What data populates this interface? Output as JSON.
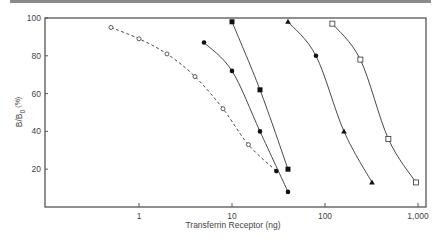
{
  "chart_data": {
    "type": "line",
    "title": "",
    "xlabel": "Transferrin Receptor  (ng)",
    "ylabel": "B/B0 (%)",
    "ylabel_main": "B/B",
    "ylabel_sub": "0",
    "ylabel_unit": " (%)",
    "x_scale": "log",
    "xlim": [
      0.3,
      1100
    ],
    "ylim": [
      0,
      100
    ],
    "x_ticks": [
      1,
      10,
      100,
      1000
    ],
    "x_tick_labels": [
      "1",
      "10",
      "100",
      "1,000"
    ],
    "y_ticks": [
      20,
      40,
      60,
      80,
      100
    ],
    "y_tick_labels": [
      "20",
      "40",
      "60",
      "80",
      "100"
    ],
    "grid": false,
    "legend": null,
    "series": [
      {
        "name": "open-circle-dashed",
        "marker": "open-circle",
        "line": "dashed",
        "x": [
          0.5,
          1,
          2,
          4,
          8,
          15,
          30
        ],
        "y": [
          95,
          89,
          81,
          69,
          52,
          33,
          19
        ]
      },
      {
        "name": "filled-circle",
        "marker": "filled-circle",
        "line": "solid",
        "x": [
          5,
          10,
          20,
          40
        ],
        "y": [
          87,
          72,
          40,
          8
        ]
      },
      {
        "name": "filled-square",
        "marker": "filled-square",
        "line": "solid",
        "x": [
          10,
          20,
          40
        ],
        "y": [
          98,
          62,
          20
        ]
      },
      {
        "name": "filled-triangle",
        "marker": "filled-triangle",
        "line": "solid",
        "x": [
          40,
          80,
          160,
          320
        ],
        "y": [
          98,
          80,
          40,
          13
        ]
      },
      {
        "name": "open-square",
        "marker": "open-square",
        "line": "solid",
        "x": [
          120,
          240,
          480,
          950
        ],
        "y": [
          97,
          78,
          36,
          13
        ]
      }
    ]
  },
  "colors": {
    "axis": "#555555",
    "line": "#333333",
    "rule": "#8a8a8a"
  }
}
